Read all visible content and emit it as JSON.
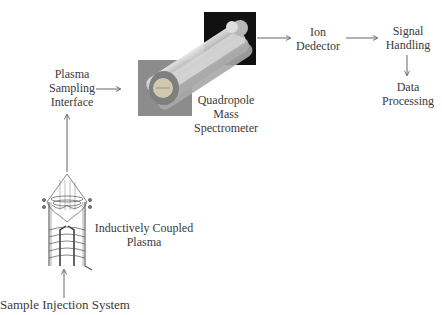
{
  "diagram": {
    "type": "flow-diagram",
    "nodes": [
      {
        "id": "sample_injection",
        "label": "Sample Injection System"
      },
      {
        "id": "icp",
        "label_lines": [
          "Inductively Coupled",
          "Plasma"
        ]
      },
      {
        "id": "sampling_interface",
        "label_lines": [
          "Plasma",
          "Sampling",
          "Interface"
        ]
      },
      {
        "id": "quadrupole",
        "label_lines": [
          "Quadropole",
          "Mass",
          "Spectrometer"
        ]
      },
      {
        "id": "ion_detector",
        "label_lines": [
          "Ion",
          "Dedector"
        ]
      },
      {
        "id": "signal_handling",
        "label_lines": [
          "Signal",
          "Handling"
        ]
      },
      {
        "id": "data_processing",
        "label_lines": [
          "Data",
          "Processing"
        ]
      }
    ],
    "edges": [
      {
        "from": "sample_injection",
        "to": "icp"
      },
      {
        "from": "icp",
        "to": "sampling_interface"
      },
      {
        "from": "sampling_interface",
        "to": "quadrupole"
      },
      {
        "from": "quadrupole",
        "to": "ion_detector"
      },
      {
        "from": "ion_detector",
        "to": "signal_handling"
      },
      {
        "from": "signal_handling",
        "to": "data_processing"
      }
    ]
  },
  "labels": {
    "sample_injection": "Sample Injection System",
    "icp_1": "Inductively Coupled",
    "icp_2": "Plasma",
    "psi_1": "Plasma",
    "psi_2": "Sampling",
    "psi_3": "Interface",
    "qms_1": "Quadropole",
    "qms_2": "Mass",
    "qms_3": "Spectrometer",
    "ion_1": "Ion",
    "ion_2": "Dedector",
    "sig_1": "Signal",
    "sig_2": "Handling",
    "dp_1": "Data",
    "dp_2": "Processing"
  },
  "colors": {
    "line": "#555555",
    "quad_front_box": "#8a8a8a",
    "quad_back_box": "#111111",
    "rod": "#c9c9c9"
  }
}
